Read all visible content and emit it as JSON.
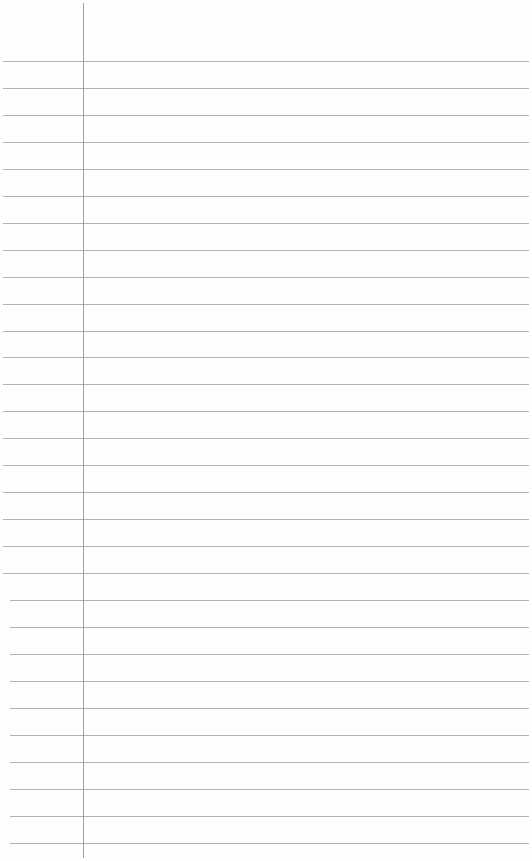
{
  "page": {
    "type": "ruled-notepad",
    "background": "#fefefe",
    "rule_color": "#9a9a9a",
    "margin_line_color": "#8a8a8a",
    "margin_x": 83,
    "first_rule_y": 61,
    "rule_spacing": 26.95,
    "rule_count": 30,
    "content": ""
  }
}
